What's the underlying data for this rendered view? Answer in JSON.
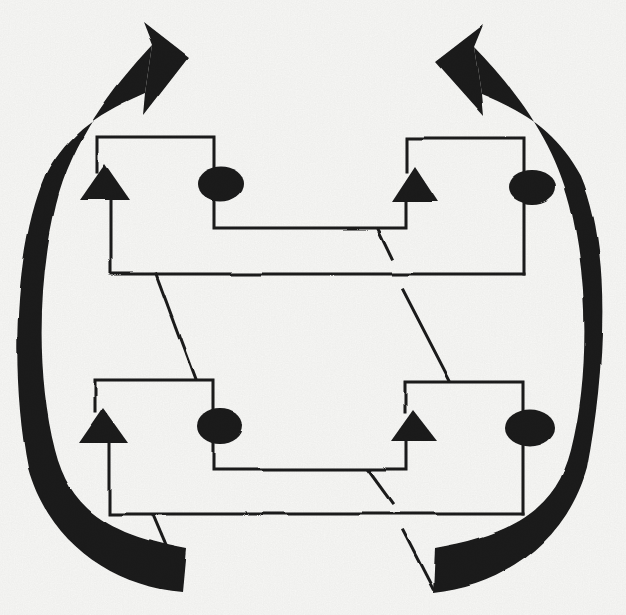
{
  "canvas": {
    "width": 626,
    "height": 615,
    "background": "#fbfbf9",
    "ink": "#1b1b1b",
    "stroke_width": 3
  },
  "figure": {
    "kind": "scanned-cycle-diagram",
    "rows": 2,
    "units_per_row": 2,
    "shapes": [
      {
        "name": "cycle-arrow-left-band",
        "type": "path",
        "fill": true,
        "d": "M 152 45 C 112 88 72 140 56 205 C 38 278 36 375 55 450 C 70 510 110 535 186 549 L 182 592 C 110 586 48 540 28 468 C 10 375 14 248 45 176 C 69 131 103 111 145 93 Z"
      },
      {
        "name": "cycle-arrow-left-head",
        "type": "polygon",
        "fill": true,
        "points": "188,57 143,22 152,45 145,93 143,115"
      },
      {
        "name": "cycle-arrow-right-band",
        "type": "path",
        "fill": true,
        "d": "M 474 47 C 514 88 554 140 570 205 C 588 278 590 375 571 450 C 556 510 511 535 435 548 L 433 593 C 505 586 567 540 587 468 C 605 375 612 248 581 176 C 557 131 523 111 481 94 Z"
      },
      {
        "name": "cycle-arrow-right-head",
        "type": "polygon",
        "fill": true,
        "points": "435,62 483,25 474,47 481,94 483,116"
      },
      {
        "name": "unit-top-left-outline",
        "type": "path",
        "d": "M 97 172 L 97 137 L 214 137 L 214 228 L 406 228 L 406 202"
      },
      {
        "name": "unit-top-left-stem-baseline",
        "type": "path",
        "d": "M 111 200 L 111 274 L 524 274"
      },
      {
        "name": "unit-top-right-outline",
        "type": "path",
        "d": "M 407 172 L 407 138 L 524 138 L 524 274"
      },
      {
        "name": "unit-bottom-left-outline",
        "type": "path",
        "d": "M 95 412 L 95 380 L 213 380 L 213 469 L 406 469 L 406 441"
      },
      {
        "name": "unit-bottom-left-stem-baseline",
        "type": "path",
        "d": "M 110 443 L 110 514 L 523 514"
      },
      {
        "name": "unit-bottom-right-outline",
        "type": "path",
        "d": "M 405 412 L 405 382 L 523 382 L 523 514"
      },
      {
        "name": "crossover-upper-left",
        "type": "line",
        "x1": 156,
        "y1": 274,
        "x2": 195,
        "y2": 379
      },
      {
        "name": "crossover-upper-right-a",
        "type": "line",
        "x1": 378,
        "y1": 229,
        "x2": 392,
        "y2": 258
      },
      {
        "name": "crossover-upper-right-b",
        "type": "line",
        "x1": 403,
        "y1": 290,
        "x2": 450,
        "y2": 381
      },
      {
        "name": "crossover-lower-left",
        "type": "line",
        "x1": 152,
        "y1": 515,
        "x2": 166,
        "y2": 548
      },
      {
        "name": "crossover-lower-right-a",
        "type": "line",
        "x1": 368,
        "y1": 470,
        "x2": 392,
        "y2": 503
      },
      {
        "name": "crossover-lower-right-b",
        "type": "line",
        "x1": 403,
        "y1": 531,
        "x2": 433,
        "y2": 589
      },
      {
        "name": "triangle-top-left",
        "type": "polygon",
        "fill": true,
        "points": "105,164 80,200 130,200"
      },
      {
        "name": "triangle-top-right",
        "type": "polygon",
        "fill": true,
        "points": "415,167 392,202 438,202"
      },
      {
        "name": "triangle-bottom-left",
        "type": "polygon",
        "fill": true,
        "points": "103,408 79,443 128,443"
      },
      {
        "name": "triangle-bottom-right",
        "type": "polygon",
        "fill": true,
        "points": "413,410 391,441 437,441"
      },
      {
        "name": "ellipse-top-left",
        "type": "ellipse",
        "fill": true,
        "cx": 221,
        "cy": 184,
        "rx": 23,
        "ry": 17.5
      },
      {
        "name": "ellipse-top-right",
        "type": "ellipse",
        "fill": true,
        "cx": 532,
        "cy": 187,
        "rx": 24,
        "ry": 17
      },
      {
        "name": "ellipse-bottom-left",
        "type": "ellipse",
        "fill": true,
        "cx": 220,
        "cy": 426,
        "rx": 23,
        "ry": 18
      },
      {
        "name": "ellipse-bottom-right",
        "type": "ellipse",
        "fill": true,
        "cx": 530,
        "cy": 428,
        "rx": 25,
        "ry": 18.5
      }
    ]
  }
}
